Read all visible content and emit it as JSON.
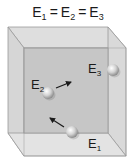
{
  "title": {
    "text": "E1 = E2 = E3",
    "parts": [
      {
        "base": "E",
        "sub": "1"
      },
      {
        "op": "="
      },
      {
        "base": "E",
        "sub": "2"
      },
      {
        "op": "="
      },
      {
        "base": "E",
        "sub": "3"
      }
    ]
  },
  "box": {
    "back": {
      "x1": 8,
      "y1": 27,
      "x2": 108,
      "y2": 133
    },
    "front": {
      "x1": 24,
      "y1": 48,
      "x2": 126,
      "y2": 156
    },
    "colors": {
      "back_wall": "#c6c6c6",
      "top_face": "#dedede",
      "left_face": "#d6d6d6",
      "right_face": "#d9d9d9",
      "floor": "#e3e3e3",
      "edge": "#9a9a9a"
    }
  },
  "particles": [
    {
      "id": "E1",
      "label_base": "E",
      "label_sub": "1",
      "cx": 72,
      "cy": 132,
      "r": 6,
      "label_x": 88,
      "label_y": 148,
      "arrow": {
        "x1": 64,
        "y1": 127,
        "x2": 50,
        "y2": 118
      }
    },
    {
      "id": "E2",
      "label_base": "E",
      "label_sub": "2",
      "cx": 48,
      "cy": 93,
      "r": 6,
      "label_x": 31,
      "label_y": 89,
      "arrow": {
        "x1": 56,
        "y1": 88,
        "x2": 71,
        "y2": 82
      }
    },
    {
      "id": "E3",
      "label_base": "E",
      "label_sub": "3",
      "cx": 113,
      "cy": 70,
      "r": 6,
      "label_x": 88,
      "label_y": 73,
      "arrow": null
    }
  ],
  "colors": {
    "sphere_light": "#ffffff",
    "sphere_mid": "#cfcfcf",
    "sphere_dark": "#8c8c8c",
    "arrow": "#1a1a1a",
    "text": "#1a1a1a"
  }
}
